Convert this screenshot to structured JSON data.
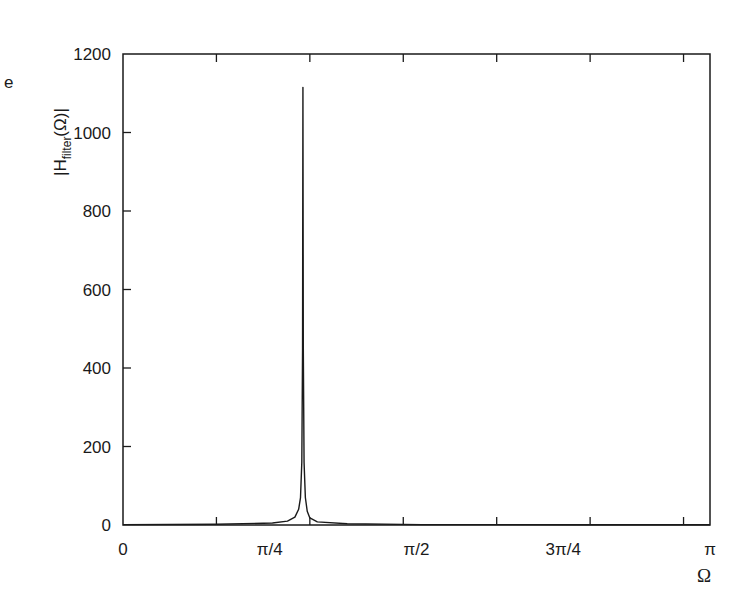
{
  "figure": {
    "edge_fragment": "e",
    "ylabel_main": "|H",
    "ylabel_sub": "filter",
    "ylabel_tail": "(Ω)|",
    "xlabel": "Ω"
  },
  "chart_data": {
    "type": "line",
    "title": "",
    "xlabel": "Ω",
    "ylabel": "|H_filter(Ω)|",
    "xlim": [
      0,
      3.14159
    ],
    "ylim": [
      0,
      1200
    ],
    "grid": false,
    "legend": null,
    "x_tick_labels": [
      {
        "value": 0,
        "label": "0"
      },
      {
        "value": 0.7854,
        "label": "π/4"
      },
      {
        "value": 1.5708,
        "label": "π/2"
      },
      {
        "value": 2.3562,
        "label": "3π/4"
      },
      {
        "value": 3.14159,
        "label": "π"
      }
    ],
    "x_minor_ticks": [
      0.5,
      1.0,
      1.5,
      2.0,
      2.5,
      3.0
    ],
    "y_ticks": [
      0,
      200,
      400,
      600,
      800,
      1000,
      1200
    ],
    "series": [
      {
        "name": "|H_filter(Ω)|",
        "color": "#1a1a1a",
        "peak": {
          "omega": 0.963,
          "value": 1115
        },
        "description": "Sharp resonant peak near Ω ≈ 0.306π, near zero elsewhere",
        "x": [
          0.0,
          0.5,
          0.8,
          0.88,
          0.92,
          0.94,
          0.95,
          0.957,
          0.961,
          0.963,
          0.965,
          0.969,
          0.976,
          0.986,
          1.0,
          1.04,
          1.2,
          1.6,
          2.0,
          2.5,
          3.14159
        ],
        "y": [
          1,
          2,
          5,
          10,
          20,
          40,
          70,
          160,
          450,
          1115,
          450,
          160,
          70,
          35,
          18,
          8,
          3,
          1,
          1,
          0.5,
          0.5
        ]
      }
    ]
  }
}
